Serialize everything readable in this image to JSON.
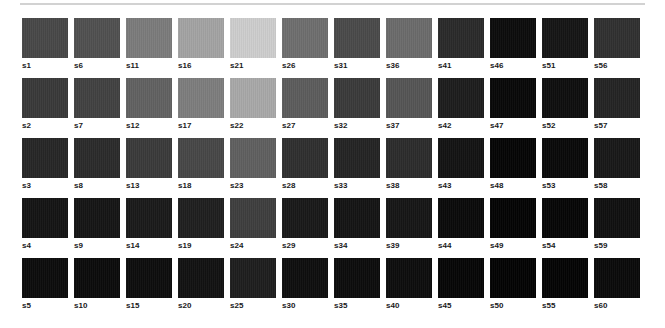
{
  "page": {
    "background_color": "#ffffff",
    "rule_color": "#d2d2d2"
  },
  "legend": {
    "label_prefix": "s",
    "label_color": "#1a1a1a"
  },
  "chart_data": {
    "type": "heatmap",
    "subtitle": "",
    "xlabel": "",
    "ylabel": "",
    "grid": false,
    "legend_position": "none",
    "columns": 12,
    "rows": 5,
    "numbering_order": "column-major",
    "value_unit": "hex",
    "x": [
      "c1",
      "c2",
      "c3",
      "c4",
      "c5",
      "c6",
      "c7",
      "c8",
      "c9",
      "c10",
      "c11",
      "c12"
    ],
    "y": [
      "r1",
      "r2",
      "r3",
      "r4",
      "r5"
    ],
    "swatches": [
      {
        "id": "s1",
        "row": 1,
        "col": 1,
        "label": "s1",
        "color": "#484848"
      },
      {
        "id": "s6",
        "row": 1,
        "col": 2,
        "label": "s6",
        "color": "#505050"
      },
      {
        "id": "s11",
        "row": 1,
        "col": 3,
        "label": "s11",
        "color": "#7b7b7b"
      },
      {
        "id": "s16",
        "row": 1,
        "col": 4,
        "label": "s16",
        "color": "#a3a3a3"
      },
      {
        "id": "s21",
        "row": 1,
        "col": 5,
        "label": "s21",
        "color": "#cdcdcd"
      },
      {
        "id": "s26",
        "row": 1,
        "col": 6,
        "label": "s26",
        "color": "#6e6e6e"
      },
      {
        "id": "s31",
        "row": 1,
        "col": 7,
        "label": "s31",
        "color": "#4a4a4a"
      },
      {
        "id": "s36",
        "row": 1,
        "col": 8,
        "label": "s36",
        "color": "#6b6b6b"
      },
      {
        "id": "s41",
        "row": 1,
        "col": 9,
        "label": "s41",
        "color": "#2a2a2a"
      },
      {
        "id": "s46",
        "row": 1,
        "col": 10,
        "label": "s46",
        "color": "#0c0c0c"
      },
      {
        "id": "s51",
        "row": 1,
        "col": 11,
        "label": "s51",
        "color": "#151515"
      },
      {
        "id": "s56",
        "row": 1,
        "col": 12,
        "label": "s56",
        "color": "#303030"
      },
      {
        "id": "s2",
        "row": 2,
        "col": 1,
        "label": "s2",
        "color": "#393939"
      },
      {
        "id": "s7",
        "row": 2,
        "col": 2,
        "label": "s7",
        "color": "#414141"
      },
      {
        "id": "s12",
        "row": 2,
        "col": 3,
        "label": "s12",
        "color": "#616161"
      },
      {
        "id": "s17",
        "row": 2,
        "col": 4,
        "label": "s17",
        "color": "#7d7d7d"
      },
      {
        "id": "s22",
        "row": 2,
        "col": 5,
        "label": "s22",
        "color": "#a8a8a8"
      },
      {
        "id": "s27",
        "row": 2,
        "col": 6,
        "label": "s27",
        "color": "#5c5c5c"
      },
      {
        "id": "s32",
        "row": 2,
        "col": 7,
        "label": "s32",
        "color": "#3a3a3a"
      },
      {
        "id": "s37",
        "row": 2,
        "col": 8,
        "label": "s37",
        "color": "#555555"
      },
      {
        "id": "s42",
        "row": 2,
        "col": 9,
        "label": "s42",
        "color": "#1d1d1d"
      },
      {
        "id": "s47",
        "row": 2,
        "col": 10,
        "label": "s47",
        "color": "#080808"
      },
      {
        "id": "s52",
        "row": 2,
        "col": 11,
        "label": "s52",
        "color": "#0e0e0e"
      },
      {
        "id": "s57",
        "row": 2,
        "col": 12,
        "label": "s57",
        "color": "#242424"
      },
      {
        "id": "s3",
        "row": 3,
        "col": 1,
        "label": "s3",
        "color": "#262626"
      },
      {
        "id": "s8",
        "row": 3,
        "col": 2,
        "label": "s8",
        "color": "#2b2b2b"
      },
      {
        "id": "s13",
        "row": 3,
        "col": 3,
        "label": "s13",
        "color": "#3a3a3a"
      },
      {
        "id": "s18",
        "row": 3,
        "col": 4,
        "label": "s18",
        "color": "#474747"
      },
      {
        "id": "s23",
        "row": 3,
        "col": 5,
        "label": "s23",
        "color": "#5f5f5f"
      },
      {
        "id": "s28",
        "row": 3,
        "col": 6,
        "label": "s28",
        "color": "#2f2f2f"
      },
      {
        "id": "s33",
        "row": 3,
        "col": 7,
        "label": "s33",
        "color": "#242424"
      },
      {
        "id": "s38",
        "row": 3,
        "col": 8,
        "label": "s38",
        "color": "#2c2c2c"
      },
      {
        "id": "s43",
        "row": 3,
        "col": 9,
        "label": "s43",
        "color": "#131313"
      },
      {
        "id": "s48",
        "row": 3,
        "col": 10,
        "label": "s48",
        "color": "#050505"
      },
      {
        "id": "s53",
        "row": 3,
        "col": 11,
        "label": "s53",
        "color": "#090909"
      },
      {
        "id": "s58",
        "row": 3,
        "col": 12,
        "label": "s58",
        "color": "#181818"
      },
      {
        "id": "s4",
        "row": 4,
        "col": 1,
        "label": "s4",
        "color": "#141414"
      },
      {
        "id": "s9",
        "row": 4,
        "col": 2,
        "label": "s9",
        "color": "#151515"
      },
      {
        "id": "s14",
        "row": 4,
        "col": 3,
        "label": "s14",
        "color": "#1a1a1a"
      },
      {
        "id": "s19",
        "row": 4,
        "col": 4,
        "label": "s19",
        "color": "#1f1f1f"
      },
      {
        "id": "s24",
        "row": 4,
        "col": 5,
        "label": "s24",
        "color": "#3e3e3e"
      },
      {
        "id": "s29",
        "row": 4,
        "col": 6,
        "label": "s29",
        "color": "#191919"
      },
      {
        "id": "s34",
        "row": 4,
        "col": 7,
        "label": "s34",
        "color": "#141414"
      },
      {
        "id": "s39",
        "row": 4,
        "col": 8,
        "label": "s39",
        "color": "#161616"
      },
      {
        "id": "s44",
        "row": 4,
        "col": 9,
        "label": "s44",
        "color": "#0a0a0a"
      },
      {
        "id": "s49",
        "row": 4,
        "col": 10,
        "label": "s49",
        "color": "#040404"
      },
      {
        "id": "s54",
        "row": 4,
        "col": 11,
        "label": "s54",
        "color": "#060606"
      },
      {
        "id": "s59",
        "row": 4,
        "col": 12,
        "label": "s59",
        "color": "#101010"
      },
      {
        "id": "s5",
        "row": 5,
        "col": 1,
        "label": "s5",
        "color": "#0c0c0c"
      },
      {
        "id": "s10",
        "row": 5,
        "col": 2,
        "label": "s10",
        "color": "#0b0b0b"
      },
      {
        "id": "s15",
        "row": 5,
        "col": 3,
        "label": "s15",
        "color": "#0d0d0d"
      },
      {
        "id": "s20",
        "row": 5,
        "col": 4,
        "label": "s20",
        "color": "#121212"
      },
      {
        "id": "s25",
        "row": 5,
        "col": 5,
        "label": "s25",
        "color": "#1e1e1e"
      },
      {
        "id": "s30",
        "row": 5,
        "col": 6,
        "label": "s30",
        "color": "#0e0e0e"
      },
      {
        "id": "s35",
        "row": 5,
        "col": 7,
        "label": "s35",
        "color": "#0c0c0c"
      },
      {
        "id": "s40",
        "row": 5,
        "col": 8,
        "label": "s40",
        "color": "#0d0d0d"
      },
      {
        "id": "s45",
        "row": 5,
        "col": 9,
        "label": "s45",
        "color": "#060606"
      },
      {
        "id": "s50",
        "row": 5,
        "col": 10,
        "label": "s50",
        "color": "#030303"
      },
      {
        "id": "s55",
        "row": 5,
        "col": 11,
        "label": "s55",
        "color": "#040404"
      },
      {
        "id": "s60",
        "row": 5,
        "col": 12,
        "label": "s60",
        "color": "#0a0a0a"
      }
    ]
  }
}
